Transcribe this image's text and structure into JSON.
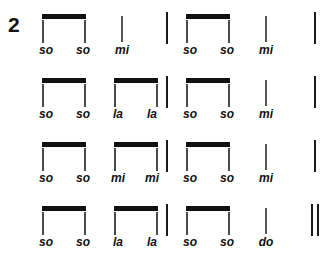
{
  "exercise": {
    "number": "2"
  },
  "colors": {
    "ink": "#111111",
    "stem": "#4a4a4a",
    "background": "#ffffff"
  },
  "score": {
    "rows": [
      {
        "id": "row-1",
        "top": 8,
        "syllables": [
          {
            "text": "so",
            "x": 46
          },
          {
            "text": "so",
            "x": 83
          },
          {
            "text": "mi",
            "x": 122
          },
          {
            "text": "so",
            "x": 190
          },
          {
            "text": "so",
            "x": 227
          },
          {
            "text": "mi",
            "x": 266
          }
        ],
        "beams": [
          {
            "x": 42,
            "width": 44
          },
          {
            "x": 186,
            "width": 44
          }
        ],
        "stems": [
          {
            "x": 121
          },
          {
            "x": 265
          }
        ],
        "barlines": [
          {
            "x": 166
          },
          {
            "x": 314
          }
        ],
        "final_barline": false
      },
      {
        "id": "row-2",
        "top": 72,
        "syllables": [
          {
            "text": "so",
            "x": 46
          },
          {
            "text": "so",
            "x": 83
          },
          {
            "text": "la",
            "x": 118
          },
          {
            "text": "la",
            "x": 152
          },
          {
            "text": "so",
            "x": 190
          },
          {
            "text": "so",
            "x": 227
          },
          {
            "text": "mi",
            "x": 266
          }
        ],
        "beams": [
          {
            "x": 42,
            "width": 44
          },
          {
            "x": 114,
            "width": 44
          },
          {
            "x": 186,
            "width": 44
          }
        ],
        "stems": [
          {
            "x": 265
          }
        ],
        "barlines": [
          {
            "x": 166
          },
          {
            "x": 314
          }
        ],
        "final_barline": false
      },
      {
        "id": "row-3",
        "top": 136,
        "syllables": [
          {
            "text": "so",
            "x": 46
          },
          {
            "text": "so",
            "x": 83
          },
          {
            "text": "mi",
            "x": 118
          },
          {
            "text": "mi",
            "x": 152
          },
          {
            "text": "so",
            "x": 190
          },
          {
            "text": "so",
            "x": 227
          },
          {
            "text": "mi",
            "x": 266
          }
        ],
        "beams": [
          {
            "x": 42,
            "width": 44
          },
          {
            "x": 114,
            "width": 44
          },
          {
            "x": 186,
            "width": 44
          }
        ],
        "stems": [
          {
            "x": 265
          }
        ],
        "barlines": [
          {
            "x": 166
          },
          {
            "x": 314
          }
        ],
        "final_barline": false
      },
      {
        "id": "row-4",
        "top": 200,
        "syllables": [
          {
            "text": "so",
            "x": 46
          },
          {
            "text": "so",
            "x": 83
          },
          {
            "text": "la",
            "x": 118
          },
          {
            "text": "la",
            "x": 152
          },
          {
            "text": "so",
            "x": 190
          },
          {
            "text": "so",
            "x": 227
          },
          {
            "text": "do",
            "x": 266
          }
        ],
        "beams": [
          {
            "x": 42,
            "width": 44
          },
          {
            "x": 114,
            "width": 44
          },
          {
            "x": 186,
            "width": 44
          }
        ],
        "stems": [
          {
            "x": 265
          }
        ],
        "barlines": [
          {
            "x": 166
          }
        ],
        "final_barline": true,
        "final_barline_x": 311
      }
    ]
  }
}
